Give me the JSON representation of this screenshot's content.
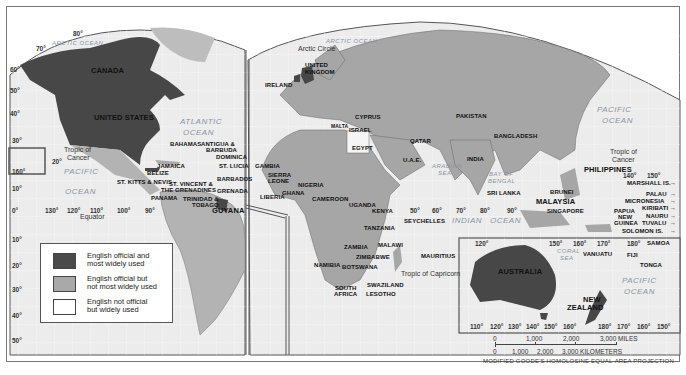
{
  "map": {
    "title": "Where English is Spoken",
    "projection": "MODIFIED GOODE'S HOMOLOSINE EQUAL-AREA PROJECTION",
    "colors": {
      "official_most_used": "#4a4a4a",
      "official_not_most_used": "#a9a9a9",
      "not_official_widely_used": "#ffffff",
      "ocean": "#ebebeb",
      "grid": "#ffffff",
      "border": "#555555"
    },
    "legend": {
      "items": [
        {
          "label_line1": "English official and",
          "label_line2": "most widely used",
          "color": "#4a4a4a"
        },
        {
          "label_line1": "English official but",
          "label_line2": "not most widely used",
          "color": "#a9a9a9"
        },
        {
          "label_line1": "English not official",
          "label_line2": "but widely used",
          "color": "#ffffff"
        }
      ]
    },
    "scale": {
      "miles": [
        "0",
        "1,000",
        "2,000",
        "3,000 MILES"
      ],
      "kilometers": [
        "0",
        "1,000",
        "2,000",
        "3,000 KILOMETERS"
      ]
    },
    "oceans": {
      "arctic_west": "ARCTIC OCEAN",
      "arctic_east": "ARCTIC OCEAN",
      "atlantic_1": "ATLANTIC",
      "atlantic_2": "OCEAN",
      "pacific_w1": "PACIFIC",
      "pacific_w2": "OCEAN",
      "pacific_e1": "PACIFIC",
      "pacific_e2": "OCEAN",
      "pacific_s1": "PACIFIC",
      "pacific_s2": "OCEAN",
      "indian_1": "INDIAN",
      "indian_2": "OCEAN",
      "arabian_1": "ARABIAN",
      "arabian_2": "SEA",
      "bengal_1": "BAY OF",
      "bengal_2": "BENGAL",
      "coral_1": "CORAL",
      "coral_2": "SEA"
    },
    "lines": {
      "arctic_circle": "Arctic Circle",
      "tropic_cancer_w1": "Tropic of",
      "tropic_cancer_w2": "Cancer",
      "tropic_cancer_e1": "Tropic of",
      "tropic_cancer_e2": "Cancer",
      "equator": "Equator",
      "tropic_capricorn": "Tropic of Capricorn"
    },
    "countries": {
      "canada": "CANADA",
      "usa": "UNITED STATES",
      "uk_1": "UNITED",
      "uk_2": "KINGDOM",
      "ireland": "IRELAND",
      "bahamas": "BAHAMAS",
      "antigua_1": "ANTIGUA &",
      "antigua_2": "BARBUDA",
      "dominica": "DOMINICA",
      "st_lucia": "ST. LUCIA",
      "jamaica": "JAMAICA",
      "belize": "BELIZE",
      "st_kitts": "ST. KITTS & NEVIS",
      "st_vincent_1": "ST. VINCENT &",
      "st_vincent_2": "THE GRENADINES",
      "barbados": "BARBADOS",
      "grenada": "GRENADA",
      "panama": "PANAMA",
      "trinidad_1": "TRINIDAD &",
      "trinidad_2": "TOBAGO",
      "guyana": "GUYANA",
      "gambia": "GAMBIA",
      "sierra_1": "SIERRA",
      "sierra_2": "LEONE",
      "liberia": "LIBERIA",
      "ghana": "GHANA",
      "nigeria": "NIGERIA",
      "cameroon": "CAMEROON",
      "uganda": "UGANDA",
      "kenya": "KENYA",
      "tanzania": "TANZANIA",
      "zambia": "ZAMBIA",
      "malawi": "MALAWI",
      "zimbabwe": "ZIMBABWE",
      "namibia": "NAMIBIA",
      "botswana": "BOTSWANA",
      "swaziland": "SWAZILAND",
      "south_africa_1": "SOUTH",
      "south_africa_2": "AFRICA",
      "lesotho": "LESOTHO",
      "malta": "MALTA",
      "cyprus": "CYPRUS",
      "israel": "ISRAEL",
      "egypt": "EGYPT",
      "qatar": "QATAR",
      "uae": "U.A.E.",
      "pakistan": "PAKISTAN",
      "india": "INDIA",
      "bangladesh": "BANGLADESH",
      "sri_lanka": "SRI LANKA",
      "seychelles": "SEYCHELLES",
      "mauritius": "MAURITIUS",
      "philippines": "PHILIPPINES",
      "brunei": "BRUNEI",
      "malaysia": "MALAYSIA",
      "singapore": "SINGAPORE",
      "png_1": "PAPUA",
      "png_2": "NEW",
      "png_3": "GUINEA",
      "marshall": "MARSHALL IS.",
      "palau": "PALAU",
      "micronesia": "MICRONESIA",
      "kiribati": "KIRIBATI",
      "nauru": "NAURU",
      "tuvalu": "TUVALU",
      "solomon": "SOLOMON IS.",
      "samoa": "SAMOA",
      "vanuatu": "VANUATU",
      "fiji": "FIJI",
      "tonga": "TONGA",
      "australia": "AUSTRALIA",
      "nz_1": "NEW",
      "nz_2": "ZEALAND"
    },
    "degrees": {
      "lat_left": [
        "80°",
        "70°",
        "60°",
        "50°",
        "40°",
        "30°",
        "20°",
        "10°",
        "0°",
        "10°",
        "20°",
        "30°",
        "40°",
        "50°"
      ],
      "lon_americas": [
        "130°",
        "120°",
        "110°",
        "100°",
        "90°"
      ],
      "lon_indian": [
        "50°",
        "60°",
        "70°",
        "80°",
        "90°"
      ],
      "lon_pacific": [
        "140°",
        "150°"
      ],
      "inset_top": [
        "120°",
        "150°",
        "160°",
        "170°",
        "180°"
      ],
      "inset_bottom": [
        "110°",
        "120°",
        "130°",
        "140°",
        "150°",
        "160°",
        "180°",
        "170°",
        "160°",
        "150°"
      ],
      "hawaii": "160°"
    }
  }
}
